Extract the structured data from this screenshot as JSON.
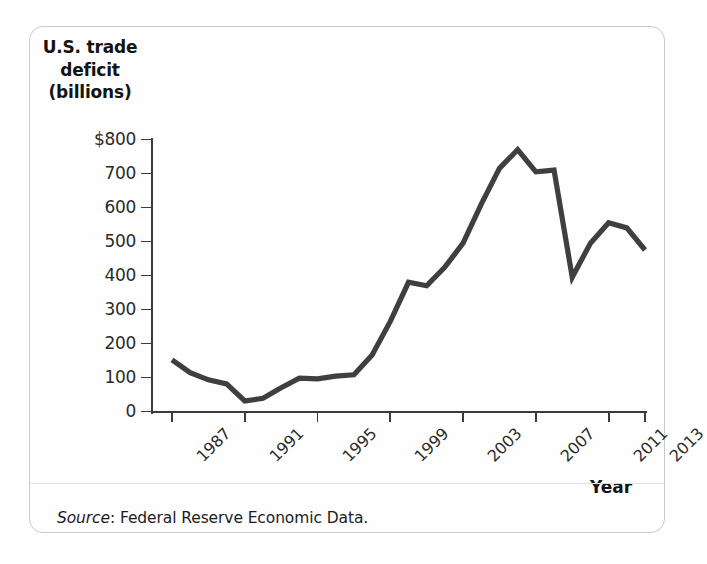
{
  "figure": {
    "y_axis_title_lines": [
      "U.S. trade",
      "deficit",
      "(billions)"
    ],
    "x_axis_title": "Year",
    "source_label": "Source",
    "source_text": ": Federal Reserve Economic Data.",
    "line_color": "#3f3f3f",
    "axis_color": "#3b3b3b",
    "frame_color": "#c9c9c9"
  },
  "chart_data": {
    "type": "line",
    "title": "",
    "subtitle": "",
    "xlabel": "Year",
    "ylabel": "U.S. trade deficit (billions)",
    "xlim": [
      1987,
      2013
    ],
    "ylim": [
      0,
      800
    ],
    "grid": false,
    "legend": "none",
    "y_tick_labels": [
      "$800",
      "700",
      "600",
      "500",
      "400",
      "300",
      "200",
      "100",
      "0"
    ],
    "y_ticks": [
      800,
      700,
      600,
      500,
      400,
      300,
      200,
      100,
      0
    ],
    "x_tick_labels": [
      "1987",
      "1991",
      "1995",
      "1999",
      "2003",
      "2007",
      "2011",
      "2013"
    ],
    "x_ticks": [
      1987,
      1991,
      1995,
      1999,
      2003,
      2007,
      2011,
      2013
    ],
    "series": [
      {
        "name": "U.S. trade deficit",
        "x": [
          1987,
          1988,
          1989,
          1990,
          1991,
          1992,
          1993,
          1994,
          1995,
          1996,
          1997,
          1998,
          1999,
          2000,
          2001,
          2002,
          2003,
          2004,
          2005,
          2006,
          2007,
          2008,
          2009,
          2010,
          2011,
          2012,
          2013
        ],
        "values": [
          152,
          114,
          93,
          81,
          31,
          39,
          70,
          98,
          96,
          104,
          108,
          166,
          265,
          380,
          370,
          425,
          495,
          610,
          715,
          770,
          705,
          710,
          395,
          495,
          555,
          540,
          475
        ]
      }
    ]
  }
}
